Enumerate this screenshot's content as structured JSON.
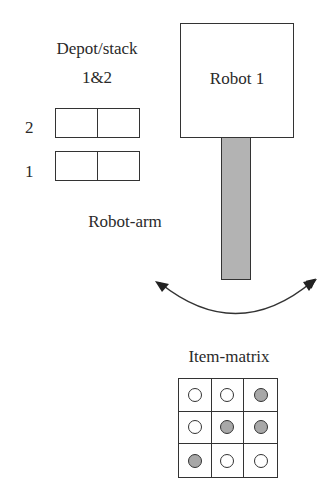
{
  "depot": {
    "title_line1": "Depot/stack",
    "title_line2": "1&2",
    "rows": [
      {
        "label": "2"
      },
      {
        "label": "1"
      }
    ]
  },
  "robot": {
    "label": "Robot 1",
    "arm_color": "#b3b3b3"
  },
  "arm": {
    "label": "Robot-arm"
  },
  "matrix": {
    "title": "Item-matrix",
    "filled_color": "#a8a8a8",
    "cells": [
      [
        "empty",
        "empty",
        "filled"
      ],
      [
        "empty",
        "filled",
        "filled"
      ],
      [
        "filled",
        "empty",
        "empty"
      ]
    ]
  }
}
